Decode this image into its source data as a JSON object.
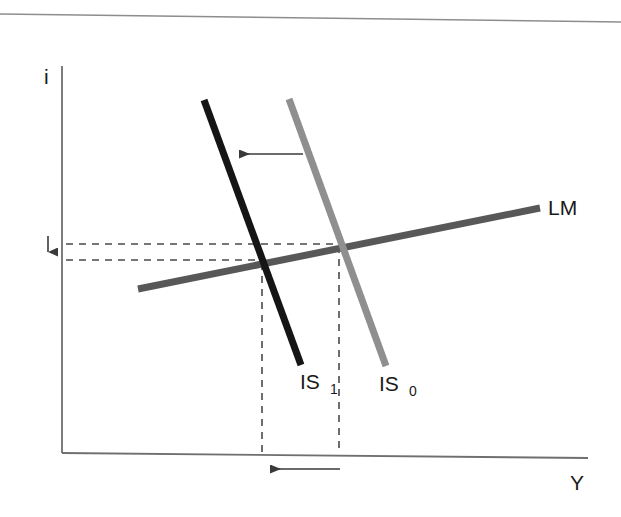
{
  "figure": {
    "type": "is-lm-macroeconomic-diagram",
    "background_color": "#ffffff",
    "page_rule": {
      "name": "page-top-rule",
      "color": "#8d8d90",
      "x1": 0,
      "y1": 14,
      "x2": 621,
      "y2": 22
    }
  },
  "axes": {
    "color": "#6f6f72",
    "vertical": {
      "label": "i",
      "label_x": 44,
      "label_y": 84,
      "x": 62,
      "y_top": 66,
      "y_bottom": 453
    },
    "horizontal": {
      "label": "Y",
      "label_x": 570,
      "label_y": 490,
      "y_left": 453,
      "y_right": 458,
      "x_left": 62,
      "x_right": 588
    }
  },
  "curves": [
    {
      "name": "IS0",
      "label": "IS",
      "subscript": "0",
      "color": "#8f8f8f",
      "width": 7,
      "x1": 289,
      "y1": 99,
      "x2": 386,
      "y2": 366,
      "label_x": 379,
      "label_y": 391,
      "sub_x": 409,
      "sub_y": 396
    },
    {
      "name": "IS1",
      "label": "IS",
      "subscript": "1",
      "color": "#151515",
      "width": 7,
      "x1": 204,
      "y1": 100,
      "x2": 301,
      "y2": 365,
      "label_x": 300,
      "label_y": 389,
      "sub_x": 330,
      "sub_y": 394
    },
    {
      "name": "LM",
      "label": "LM",
      "subscript": "",
      "color": "#585858",
      "width": 7,
      "x1": 138,
      "y1": 289,
      "x2": 540,
      "y2": 208,
      "label_x": 548,
      "label_y": 215,
      "sub_x": 0,
      "sub_y": 0
    }
  ],
  "equilibria": [
    {
      "name": "equilibrium-0",
      "x": 338,
      "y": 245
    },
    {
      "name": "equilibrium-1",
      "x": 262,
      "y": 262
    }
  ],
  "guides": {
    "color": "#4a4a4a",
    "dash": "7 6",
    "horizontal": [
      {
        "name": "interest-rate-0-guide",
        "x1": 66,
        "y1": 244,
        "x2": 340,
        "y2": 244
      },
      {
        "name": "interest-rate-1-guide",
        "x1": 66,
        "y1": 260,
        "x2": 264,
        "y2": 260
      }
    ],
    "vertical": [
      {
        "name": "output-0-guide",
        "x1": 339,
        "y1": 246,
        "x2": 339,
        "y2": 453
      },
      {
        "name": "output-1-guide",
        "x1": 262,
        "y1": 263,
        "x2": 262,
        "y2": 453
      }
    ]
  },
  "arrows": [
    {
      "name": "shift-arrow-is",
      "direction": "left",
      "color": "#3a3a3a",
      "x1": 303,
      "y1": 154,
      "x2": 231,
      "y2": 154
    },
    {
      "name": "output-decrease-arrow",
      "direction": "left",
      "color": "#3a3a3a",
      "x1": 340,
      "y1": 469,
      "x2": 262,
      "y2": 469
    },
    {
      "name": "interest-rate-decrease-arrow",
      "direction": "down",
      "color": "#3a3a3a",
      "x1": 48,
      "y1": 236,
      "x2": 48,
      "y2": 259
    }
  ],
  "chart_data": {
    "type": "line",
    "title": "",
    "xlabel": "Y",
    "ylabel": "i",
    "grid": false,
    "legend": "inline-curve-labels",
    "xlim": [
      0,
      1
    ],
    "ylim": [
      0,
      1
    ],
    "series": [
      {
        "name": "IS0",
        "label": "IS₀",
        "color": "#8f8f8f",
        "points": [
          [
            289,
            99
          ],
          [
            386,
            366
          ]
        ],
        "description": "Original IS curve, steep downward slope"
      },
      {
        "name": "IS1",
        "label": "IS₁",
        "color": "#151515",
        "points": [
          [
            204,
            100
          ],
          [
            301,
            365
          ]
        ],
        "description": "Shifted IS curve, leftward parallel shift"
      },
      {
        "name": "LM",
        "label": "LM",
        "color": "#585858",
        "points": [
          [
            138,
            289
          ],
          [
            540,
            208
          ]
        ],
        "description": "LM curve, gentle upward slope"
      }
    ],
    "annotations": [
      {
        "text": "IS shifts left",
        "type": "arrow",
        "direction": "left",
        "at": [
          267,
          154
        ]
      },
      {
        "text": "output falls",
        "type": "arrow",
        "direction": "left",
        "at": [
          301,
          469
        ]
      },
      {
        "text": "interest rate falls",
        "type": "arrow",
        "direction": "down",
        "at": [
          48,
          248
        ]
      }
    ],
    "equilibrium_points": [
      {
        "name": "E0",
        "x_px": 338,
        "y_px": 245,
        "curves": [
          "IS0",
          "LM"
        ]
      },
      {
        "name": "E1",
        "x_px": 262,
        "y_px": 262,
        "curves": [
          "IS1",
          "LM"
        ]
      }
    ]
  }
}
